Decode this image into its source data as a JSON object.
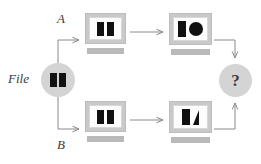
{
  "diagram": {
    "colors": {
      "node_fill": "#d4d4d4",
      "monitor_frame": "#c9c9c9",
      "monitor_screen": "#fdfdfd",
      "monitor_base": "#b9b9b9",
      "glyph": "#111111",
      "arrow": "#8a8a8a",
      "text": "#3a3a3a",
      "background": "#ffffff"
    },
    "labels": {
      "source": "File",
      "branch_a": "A",
      "branch_b": "B",
      "result": "?"
    },
    "nodes": [
      {
        "id": "source",
        "type": "circle-node",
        "label": "File",
        "glyph": "two-bars-icon",
        "glyph_shapes": [
          "rectangle",
          "rectangle"
        ]
      },
      {
        "id": "top-screen-1",
        "type": "monitor",
        "glyph": "two-bars-icon",
        "glyph_shapes": [
          "rectangle",
          "rectangle"
        ]
      },
      {
        "id": "top-screen-2",
        "type": "monitor",
        "glyph": "bar-and-circle-icon",
        "glyph_shapes": [
          "rectangle",
          "circle"
        ]
      },
      {
        "id": "bottom-screen-1",
        "type": "monitor",
        "glyph": "two-bars-icon",
        "glyph_shapes": [
          "rectangle",
          "rectangle"
        ]
      },
      {
        "id": "bottom-screen-2",
        "type": "monitor",
        "glyph": "bar-and-triangle-icon",
        "glyph_shapes": [
          "rectangle",
          "triangle"
        ]
      },
      {
        "id": "result",
        "type": "circle-node",
        "label": "?",
        "glyph": "question-mark"
      }
    ],
    "edges": [
      {
        "id": "source-to-a",
        "from": "source",
        "to": "top-screen-1",
        "style": "elbow-up-right",
        "label": "A"
      },
      {
        "id": "source-to-b",
        "from": "source",
        "to": "bottom-screen-1",
        "style": "elbow-down-right",
        "label": "B"
      },
      {
        "id": "top-1-to-2",
        "from": "top-screen-1",
        "to": "top-screen-2",
        "style": "straight-right",
        "label": ""
      },
      {
        "id": "bottom-1-to-2",
        "from": "bottom-screen-1",
        "to": "bottom-screen-2",
        "style": "straight-right",
        "label": ""
      },
      {
        "id": "top-2-to-result",
        "from": "top-screen-2",
        "to": "result",
        "style": "elbow-right-down",
        "label": ""
      },
      {
        "id": "bottom-2-to-result",
        "from": "bottom-screen-2",
        "to": "result",
        "style": "elbow-right-up",
        "label": ""
      }
    ]
  }
}
